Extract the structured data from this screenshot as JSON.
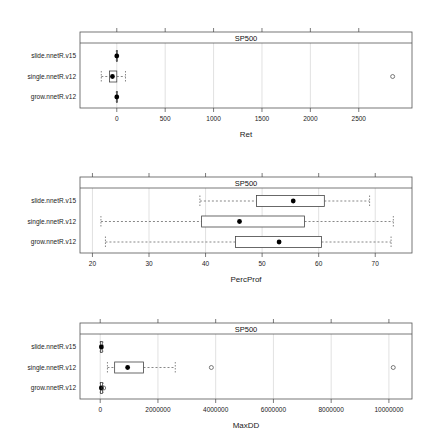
{
  "chart_data": [
    {
      "type": "boxplot",
      "strip_title": "SP500",
      "xlabel": "Ret",
      "xlim": [
        -380,
        3050
      ],
      "ticks": [
        0,
        500,
        1000,
        1500,
        2000,
        2500
      ],
      "tick_labels": [
        "0",
        "500",
        "1000",
        "1500",
        "2000",
        "2500"
      ],
      "grid": true,
      "categories": [
        "slide.nnetR.v15",
        "single.nnetR.v12",
        "grow.nnetR.v12"
      ],
      "series": [
        {
          "name": "slide.nnetR.v15",
          "whisker_low": -5,
          "q1": -3,
          "median": 0,
          "q3": 3,
          "whisker_high": 5,
          "outliers": []
        },
        {
          "name": "single.nnetR.v12",
          "whisker_low": -160,
          "q1": -75,
          "median": -45,
          "q3": 0,
          "whisker_high": 90,
          "outliers": [
            2850
          ]
        },
        {
          "name": "grow.nnetR.v12",
          "whisker_low": -5,
          "q1": -3,
          "median": 0,
          "q3": 3,
          "whisker_high": 5,
          "outliers": []
        }
      ]
    },
    {
      "type": "boxplot",
      "strip_title": "SP500",
      "xlabel": "PercProf",
      "xlim": [
        17.8,
        76.5
      ],
      "ticks": [
        20,
        30,
        40,
        50,
        60,
        70
      ],
      "tick_labels": [
        "20",
        "30",
        "40",
        "50",
        "60",
        "70"
      ],
      "grid": true,
      "categories": [
        "slide.nnetR.v15",
        "single.nnetR.v12",
        "grow.nnetR.v12"
      ],
      "series": [
        {
          "name": "slide.nnetR.v15",
          "whisker_low": 39,
          "q1": 49,
          "median": 55.5,
          "q3": 61,
          "whisker_high": 69,
          "outliers": []
        },
        {
          "name": "single.nnetR.v12",
          "whisker_low": 21.5,
          "q1": 39.3,
          "median": 46,
          "q3": 57.5,
          "whisker_high": 73.2,
          "outliers": []
        },
        {
          "name": "grow.nnetR.v12",
          "whisker_low": 22.3,
          "q1": 45.3,
          "median": 53,
          "q3": 60.5,
          "whisker_high": 72.8,
          "outliers": []
        }
      ]
    },
    {
      "type": "boxplot",
      "strip_title": "SP500",
      "xlabel": "MaxDD",
      "xlim": [
        -700000,
        10800000
      ],
      "ticks": [
        0,
        2000000,
        4000000,
        6000000,
        8000000,
        10000000
      ],
      "tick_labels": [
        "0",
        "2000000",
        "4000000",
        "6000000",
        "8000000",
        "10000000"
      ],
      "grid": true,
      "categories": [
        "slide.nnetR.v15",
        "single.nnetR.v12",
        "grow.nnetR.v12"
      ],
      "series": [
        {
          "name": "slide.nnetR.v15",
          "whisker_low": 0,
          "q1": 10000,
          "median": 40000,
          "q3": 70000,
          "whisker_high": 90000,
          "outliers": []
        },
        {
          "name": "single.nnetR.v12",
          "whisker_low": 250000,
          "q1": 500000,
          "median": 950000,
          "q3": 1500000,
          "whisker_high": 2600000,
          "outliers": [
            3850000,
            10150000
          ]
        },
        {
          "name": "grow.nnetR.v12",
          "whisker_low": 0,
          "q1": 10000,
          "median": 40000,
          "q3": 80000,
          "whisker_high": 100000,
          "outliers": [
            120000
          ]
        }
      ]
    }
  ]
}
